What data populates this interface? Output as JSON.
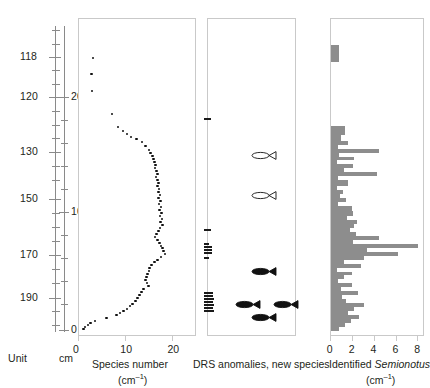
{
  "figure": {
    "width": 429,
    "height": 388,
    "background": "#ffffff",
    "ink": "#231f20",
    "bar_color": "#8d8d8d",
    "dot_color": "#111111",
    "frame_color": "#c9c9c9",
    "ruler_color": "#8a8a8a"
  },
  "axes": {
    "unit_axis": {
      "label": "Unit",
      "ticks": [
        {
          "value": "118",
          "y": 57
        },
        {
          "value": "120",
          "y": 97
        },
        {
          "value": "130",
          "y": 152
        },
        {
          "value": "150",
          "y": 199
        },
        {
          "value": "170",
          "y": 255
        },
        {
          "value": "190",
          "y": 298
        }
      ],
      "minor_tick_ys": [
        30,
        44,
        70,
        84,
        111,
        125,
        138,
        166,
        180,
        213,
        227,
        241,
        269,
        283,
        311,
        325
      ],
      "top_y": 26,
      "bottom_y": 332
    },
    "cm_axis": {
      "label": "cm",
      "ticks": [
        {
          "value": "200",
          "y": 97
        },
        {
          "value": "100",
          "y": 212
        },
        {
          "value": "0",
          "y": 330
        }
      ],
      "minor_tick_ys": [
        120,
        143,
        166,
        189,
        235,
        258,
        281,
        304
      ],
      "top_y": 26,
      "bottom_y": 332
    }
  },
  "chart_data": [
    {
      "type": "scatter",
      "title": "Species number",
      "xlabel": "Species number (cm⁻¹)",
      "ylabel": "",
      "xlim": [
        0,
        25
      ],
      "xticks": [
        0,
        10,
        20
      ],
      "xticklabels": [
        "0",
        "10",
        "20"
      ],
      "grid": false,
      "legend": "none",
      "caption_line1": "Species number",
      "caption_line2": "(cm⁻¹)",
      "points": [
        {
          "x": 3.2,
          "y": 58
        },
        {
          "x": 2.9,
          "y": 74
        },
        {
          "x": 3.0,
          "y": 91
        },
        {
          "x": 7.2,
          "y": 114
        },
        {
          "x": 8.5,
          "y": 127
        },
        {
          "x": 9.5,
          "y": 131
        },
        {
          "x": 10.4,
          "y": 134
        },
        {
          "x": 11.2,
          "y": 137
        },
        {
          "x": 12.4,
          "y": 139
        },
        {
          "x": 13.6,
          "y": 142
        },
        {
          "x": 14.3,
          "y": 146
        },
        {
          "x": 15.0,
          "y": 150
        },
        {
          "x": 15.4,
          "y": 153
        },
        {
          "x": 15.8,
          "y": 156
        },
        {
          "x": 16.0,
          "y": 159
        },
        {
          "x": 16.2,
          "y": 162
        },
        {
          "x": 16.4,
          "y": 165
        },
        {
          "x": 16.3,
          "y": 168
        },
        {
          "x": 16.6,
          "y": 171
        },
        {
          "x": 16.8,
          "y": 174
        },
        {
          "x": 16.5,
          "y": 177
        },
        {
          "x": 16.9,
          "y": 180
        },
        {
          "x": 17.1,
          "y": 183
        },
        {
          "x": 16.8,
          "y": 186
        },
        {
          "x": 17.2,
          "y": 189
        },
        {
          "x": 17.0,
          "y": 192
        },
        {
          "x": 17.4,
          "y": 195
        },
        {
          "x": 17.1,
          "y": 198
        },
        {
          "x": 17.5,
          "y": 201
        },
        {
          "x": 17.2,
          "y": 204
        },
        {
          "x": 17.6,
          "y": 207
        },
        {
          "x": 17.3,
          "y": 210
        },
        {
          "x": 17.7,
          "y": 213
        },
        {
          "x": 17.4,
          "y": 216
        },
        {
          "x": 17.8,
          "y": 219
        },
        {
          "x": 17.5,
          "y": 222
        },
        {
          "x": 17.9,
          "y": 225
        },
        {
          "x": 17.4,
          "y": 228
        },
        {
          "x": 17.0,
          "y": 231
        },
        {
          "x": 16.6,
          "y": 234
        },
        {
          "x": 16.3,
          "y": 237
        },
        {
          "x": 16.8,
          "y": 240
        },
        {
          "x": 17.3,
          "y": 243
        },
        {
          "x": 17.6,
          "y": 246
        },
        {
          "x": 17.9,
          "y": 248
        },
        {
          "x": 18.1,
          "y": 251
        },
        {
          "x": 18.4,
          "y": 254
        },
        {
          "x": 17.6,
          "y": 257
        },
        {
          "x": 16.9,
          "y": 260
        },
        {
          "x": 16.2,
          "y": 262
        },
        {
          "x": 15.6,
          "y": 265
        },
        {
          "x": 15.2,
          "y": 268
        },
        {
          "x": 15.0,
          "y": 271
        },
        {
          "x": 14.7,
          "y": 274
        },
        {
          "x": 14.5,
          "y": 277
        },
        {
          "x": 14.3,
          "y": 280
        },
        {
          "x": 14.6,
          "y": 283
        },
        {
          "x": 14.9,
          "y": 286
        },
        {
          "x": 13.9,
          "y": 289
        },
        {
          "x": 13.4,
          "y": 292
        },
        {
          "x": 13.0,
          "y": 295
        },
        {
          "x": 12.6,
          "y": 298
        },
        {
          "x": 12.2,
          "y": 301
        },
        {
          "x": 11.6,
          "y": 304
        },
        {
          "x": 11.0,
          "y": 306
        },
        {
          "x": 10.4,
          "y": 309
        },
        {
          "x": 9.6,
          "y": 311
        },
        {
          "x": 8.9,
          "y": 313
        },
        {
          "x": 8.2,
          "y": 315
        },
        {
          "x": 6.1,
          "y": 318
        },
        {
          "x": 3.6,
          "y": 321
        },
        {
          "x": 2.7,
          "y": 323
        },
        {
          "x": 2.1,
          "y": 325
        },
        {
          "x": 1.5,
          "y": 327
        },
        {
          "x": 1.2,
          "y": 329
        }
      ]
    },
    {
      "type": "scatter",
      "title": "DRS anomalies, new species",
      "xlabel": "DRS anomalies, new species",
      "caption_line1": "DRS anomalies, new species",
      "caption_line2": "",
      "grid": false,
      "legend": "none",
      "anomaly_marks": [
        {
          "y": 118,
          "w": 7
        },
        {
          "y": 229,
          "w": 7
        },
        {
          "y": 243,
          "w": 5
        },
        {
          "y": 246,
          "w": 8
        },
        {
          "y": 249,
          "w": 8
        },
        {
          "y": 252,
          "w": 8
        },
        {
          "y": 257,
          "w": 5
        },
        {
          "y": 292,
          "w": 9
        },
        {
          "y": 295,
          "w": 9
        },
        {
          "y": 298,
          "w": 10
        },
        {
          "y": 301,
          "w": 9
        },
        {
          "y": 304,
          "w": 10
        },
        {
          "y": 307,
          "w": 9
        },
        {
          "y": 310,
          "w": 10
        }
      ],
      "fish": [
        {
          "x": 44,
          "y": 152,
          "filled": false
        },
        {
          "x": 44,
          "y": 192,
          "filled": false
        },
        {
          "x": 44,
          "y": 268,
          "filled": true
        },
        {
          "x": 28,
          "y": 301,
          "filled": true
        },
        {
          "x": 66,
          "y": 301,
          "filled": true
        },
        {
          "x": 44,
          "y": 314,
          "filled": true
        }
      ]
    },
    {
      "type": "bar",
      "orientation": "horizontal",
      "title": "Identified Semionotus",
      "xlabel": "Identified Semionotus (cm⁻¹)",
      "caption_line1": "Identified Semionotus",
      "caption_line2": "(cm⁻¹)",
      "xlim": [
        0,
        8.6
      ],
      "xticks": [
        0,
        2,
        4,
        6,
        8
      ],
      "xticklabels": [
        "0",
        "2",
        "4",
        "6",
        "8"
      ],
      "grid": false,
      "legend": "none",
      "bars": [
        {
          "y": 45,
          "h": 17,
          "value": 0.75
        },
        {
          "y": 126,
          "h": 9,
          "value": 1.3
        },
        {
          "y": 135,
          "h": 6,
          "value": 0.95
        },
        {
          "y": 141,
          "h": 4,
          "value": 1.55
        },
        {
          "y": 145,
          "h": 4,
          "value": 0.6
        },
        {
          "y": 149,
          "h": 4,
          "value": 4.4
        },
        {
          "y": 153,
          "h": 4,
          "value": 0.75
        },
        {
          "y": 157,
          "h": 3,
          "value": 2.1
        },
        {
          "y": 160,
          "h": 4,
          "value": 0.55
        },
        {
          "y": 164,
          "h": 4,
          "value": 2.0
        },
        {
          "y": 168,
          "h": 4,
          "value": 1.2
        },
        {
          "y": 172,
          "h": 4,
          "value": 4.2
        },
        {
          "y": 176,
          "h": 4,
          "value": 0.6
        },
        {
          "y": 180,
          "h": 6,
          "value": 1.55
        },
        {
          "y": 186,
          "h": 4,
          "value": 0.55
        },
        {
          "y": 190,
          "h": 4,
          "value": 1.1
        },
        {
          "y": 194,
          "h": 4,
          "value": 0.85
        },
        {
          "y": 198,
          "h": 4,
          "value": 1.35
        },
        {
          "y": 202,
          "h": 4,
          "value": 0.6
        },
        {
          "y": 206,
          "h": 5,
          "value": 1.9
        },
        {
          "y": 211,
          "h": 5,
          "value": 2.05
        },
        {
          "y": 216,
          "h": 4,
          "value": 1.5
        },
        {
          "y": 220,
          "h": 4,
          "value": 2.4
        },
        {
          "y": 224,
          "h": 4,
          "value": 2.1
        },
        {
          "y": 228,
          "h": 4,
          "value": 1.7
        },
        {
          "y": 232,
          "h": 4,
          "value": 2.25
        },
        {
          "y": 236,
          "h": 4,
          "value": 4.4
        },
        {
          "y": 240,
          "h": 4,
          "value": 2.0
        },
        {
          "y": 244,
          "h": 4,
          "value": 8.0
        },
        {
          "y": 248,
          "h": 4,
          "value": 3.3
        },
        {
          "y": 252,
          "h": 4,
          "value": 6.1
        },
        {
          "y": 256,
          "h": 4,
          "value": 3.0
        },
        {
          "y": 260,
          "h": 4,
          "value": 1.2
        },
        {
          "y": 264,
          "h": 4,
          "value": 2.7
        },
        {
          "y": 268,
          "h": 4,
          "value": 0.55
        },
        {
          "y": 272,
          "h": 3,
          "value": 1.9
        },
        {
          "y": 275,
          "h": 4,
          "value": 1.15
        },
        {
          "y": 279,
          "h": 4,
          "value": 0.6
        },
        {
          "y": 283,
          "h": 4,
          "value": 1.9
        },
        {
          "y": 287,
          "h": 4,
          "value": 0.95
        },
        {
          "y": 291,
          "h": 4,
          "value": 2.45
        },
        {
          "y": 295,
          "h": 4,
          "value": 1.0
        },
        {
          "y": 299,
          "h": 4,
          "value": 1.35
        },
        {
          "y": 303,
          "h": 4,
          "value": 3.05
        },
        {
          "y": 307,
          "h": 4,
          "value": 2.1
        },
        {
          "y": 311,
          "h": 4,
          "value": 1.55
        },
        {
          "y": 315,
          "h": 4,
          "value": 2.6
        },
        {
          "y": 319,
          "h": 4,
          "value": 1.85
        },
        {
          "y": 323,
          "h": 4,
          "value": 1.25
        },
        {
          "y": 327,
          "h": 4,
          "value": 0.7
        }
      ]
    }
  ],
  "captions": {
    "panel1_line1": "Species number",
    "panel1_line2": "(cm",
    "panel1_line2_sup": "–1",
    "panel1_line2_end": ")",
    "panel2": "DRS anomalies, new species",
    "panel3_plain": "Identified ",
    "panel3_italic": "Semionotus",
    "panel3_line2": "(cm",
    "panel3_line2_sup": "–1",
    "panel3_line2_end": ")"
  }
}
